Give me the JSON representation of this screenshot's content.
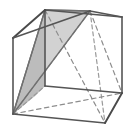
{
  "figure": {
    "name": "cube-with-shaded-triangular-cross-section",
    "kind": "geometry-diagram",
    "canvas": {
      "width": 134,
      "height": 135,
      "background": "#ffffff"
    },
    "colors": {
      "visible_edge": "#555555",
      "visible_edge_dark": "#4a4a4a",
      "hidden_edge": "#9a9a9a",
      "diagonal_dashed": "#8d8d8d",
      "diagonal_solid": "#6a6a6a",
      "section_fill_light": "#d6d6d6",
      "section_fill_mid": "#cbcbcb",
      "section_fill_dark": "#bdbdbd",
      "section_outline": "#707070"
    },
    "vertices": {
      "front_top_left": {
        "label": "A",
        "x": 45,
        "y": 10
      },
      "front_top_right": {
        "label": "B",
        "x": 122,
        "y": 17
      },
      "front_bottom_right": {
        "label": "C",
        "x": 122,
        "y": 93
      },
      "front_bottom_left": {
        "label": "D",
        "x": 45,
        "y": 86
      },
      "back_top_left": {
        "label": "E",
        "x": 13,
        "y": 38
      },
      "back_top_right": {
        "label": "F",
        "x": 90,
        "y": 11
      },
      "back_bottom_right": {
        "label": "G",
        "x": 105,
        "y": 123
      },
      "back_bottom_left": {
        "label": "H",
        "x": 13,
        "y": 114
      }
    },
    "visible_edges": [
      [
        "front_top_left",
        "front_top_right"
      ],
      [
        "front_top_right",
        "front_bottom_right"
      ],
      [
        "front_bottom_right",
        "front_bottom_left"
      ],
      [
        "front_bottom_left",
        "front_top_left"
      ],
      [
        "front_top_left",
        "back_top_left"
      ],
      [
        "back_top_left",
        "back_bottom_left"
      ],
      [
        "back_bottom_left",
        "back_bottom_right"
      ],
      [
        "back_bottom_right",
        "front_bottom_right"
      ],
      [
        "back_top_left",
        "back_top_right"
      ],
      [
        "back_top_right",
        "front_top_right"
      ]
    ],
    "hidden_edges": [
      [
        "back_top_right",
        "back_bottom_right"
      ],
      [
        "back_bottom_left",
        "front_bottom_left"
      ]
    ],
    "cross_section": {
      "shaded": true,
      "fill": "#cbcbcb",
      "polygon": [
        "front_top_left",
        "back_bottom_left",
        "front_bottom_left"
      ],
      "second_polygon": [
        "front_top_left",
        "back_top_right",
        "back_bottom_left"
      ]
    },
    "diagonals_dashed": [
      [
        "front_top_left",
        "back_bottom_right"
      ],
      [
        "back_top_right",
        "back_bottom_left"
      ],
      [
        "back_top_right",
        "front_bottom_right"
      ],
      [
        "back_bottom_left",
        "front_bottom_right"
      ]
    ],
    "diagonals_solid": [
      [
        "front_top_left",
        "back_bottom_left"
      ]
    ],
    "labels": []
  }
}
